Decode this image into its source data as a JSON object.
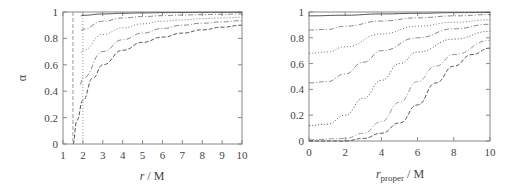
{
  "chart_data": [
    {
      "type": "line",
      "title": "",
      "xlabel": "r / M",
      "ylabel": "α",
      "xlim": [
        1,
        10
      ],
      "ylim": [
        0,
        1
      ],
      "xticks": [
        1,
        2,
        3,
        4,
        5,
        6,
        7,
        8,
        9,
        10
      ],
      "yticks": [
        0,
        0.2,
        0.4,
        0.6,
        0.8,
        1
      ],
      "ytick_labels": [
        "0",
        "0.2",
        "0.4",
        "0.6",
        "0.8",
        "1"
      ],
      "grid": false,
      "legend": null,
      "vertical_lines": [
        {
          "x": 1.5,
          "style": "dashed"
        },
        {
          "x": 2.0,
          "style": "dotted"
        }
      ],
      "series": [
        {
          "name": "curve-1",
          "style": "solid",
          "x": [
            1.9,
            2,
            3,
            4,
            5,
            6,
            7,
            8,
            9,
            10
          ],
          "values": [
            0.97,
            0.975,
            0.985,
            0.99,
            0.993,
            0.995,
            0.996,
            0.997,
            0.998,
            0.998
          ]
        },
        {
          "name": "curve-2",
          "style": "dash-dot",
          "x": [
            1.9,
            2,
            3,
            4,
            5,
            6,
            7,
            8,
            9,
            10
          ],
          "values": [
            0.86,
            0.87,
            0.93,
            0.955,
            0.965,
            0.972,
            0.977,
            0.98,
            0.983,
            0.985
          ]
        },
        {
          "name": "curve-3",
          "style": "dotted",
          "x": [
            1.9,
            2,
            3,
            4,
            5,
            6,
            7,
            8,
            9,
            10
          ],
          "values": [
            0.69,
            0.71,
            0.83,
            0.88,
            0.91,
            0.93,
            0.94,
            0.95,
            0.955,
            0.96
          ]
        },
        {
          "name": "curve-4",
          "style": "dash-dot",
          "x": [
            1.85,
            2,
            3,
            4,
            5,
            6,
            7,
            8,
            9,
            10
          ],
          "values": [
            0.45,
            0.5,
            0.7,
            0.79,
            0.84,
            0.875,
            0.9,
            0.915,
            0.925,
            0.935
          ]
        },
        {
          "name": "curve-5",
          "style": "dashed",
          "x": [
            1.5,
            1.7,
            2,
            2.5,
            3,
            4,
            5,
            6,
            7,
            8,
            9,
            10
          ],
          "values": [
            0.0,
            0.18,
            0.33,
            0.5,
            0.6,
            0.71,
            0.77,
            0.81,
            0.84,
            0.865,
            0.885,
            0.9
          ]
        }
      ]
    },
    {
      "type": "line",
      "title": "",
      "xlabel": "r_proper / M",
      "ylabel": "",
      "xlim": [
        0,
        10
      ],
      "ylim": [
        0,
        1
      ],
      "xticks": [
        0,
        2,
        4,
        6,
        8,
        10
      ],
      "yticks": [
        0,
        0.2,
        0.4,
        0.6,
        0.8,
        1
      ],
      "ytick_labels": [
        "0",
        "0.2",
        "0.4",
        "0.6",
        "0.8",
        "1"
      ],
      "grid": false,
      "legend": null,
      "series": [
        {
          "name": "curve-1",
          "style": "solid",
          "x": [
            0,
            2,
            4,
            6,
            8,
            10
          ],
          "values": [
            0.97,
            0.975,
            0.985,
            0.99,
            0.995,
            0.997
          ]
        },
        {
          "name": "curve-2",
          "style": "dash-dot",
          "x": [
            0,
            1,
            2,
            4,
            6,
            8,
            10
          ],
          "values": [
            0.86,
            0.865,
            0.89,
            0.93,
            0.955,
            0.97,
            0.98
          ]
        },
        {
          "name": "curve-3",
          "style": "dotted",
          "x": [
            0,
            1,
            2,
            4,
            6,
            8,
            10
          ],
          "values": [
            0.68,
            0.69,
            0.73,
            0.83,
            0.89,
            0.92,
            0.94
          ]
        },
        {
          "name": "curve-4",
          "style": "dash-dot",
          "x": [
            0,
            1,
            2,
            3,
            4,
            6,
            8,
            10
          ],
          "values": [
            0.45,
            0.46,
            0.52,
            0.61,
            0.7,
            0.8,
            0.87,
            0.905
          ]
        },
        {
          "name": "curve-5",
          "style": "dotted",
          "x": [
            0,
            1,
            2,
            3,
            4,
            5,
            6,
            8,
            10
          ],
          "values": [
            0.12,
            0.13,
            0.2,
            0.33,
            0.47,
            0.6,
            0.69,
            0.79,
            0.85
          ]
        },
        {
          "name": "curve-6",
          "style": "dash-dot",
          "x": [
            0,
            2,
            3,
            4,
            5,
            6,
            7,
            8,
            10
          ],
          "values": [
            0.01,
            0.02,
            0.06,
            0.15,
            0.3,
            0.46,
            0.58,
            0.67,
            0.78
          ]
        },
        {
          "name": "curve-7",
          "style": "dashed",
          "x": [
            0,
            2,
            3,
            4,
            5,
            6,
            7,
            8,
            9,
            10
          ],
          "values": [
            0.0,
            0.0,
            0.02,
            0.06,
            0.14,
            0.28,
            0.45,
            0.58,
            0.67,
            0.72
          ]
        }
      ]
    }
  ],
  "left_plot": {
    "xlabel_var": "r",
    "xlabel_rest": " / M",
    "ylabel": "α",
    "xtick_labels": [
      "1",
      "2",
      "3",
      "4",
      "5",
      "6",
      "7",
      "8",
      "9",
      "10"
    ],
    "ytick_labels": [
      "0",
      "0.2",
      "0.4",
      "0.6",
      "0.8",
      "1"
    ]
  },
  "right_plot": {
    "xlabel_var": "r",
    "xlabel_sub": "proper",
    "xlabel_rest": " / M",
    "xtick_labels": [
      "0",
      "2",
      "4",
      "6",
      "8",
      "10"
    ],
    "ytick_labels": [
      "0",
      "0.2",
      "0.4",
      "0.6",
      "0.8",
      "1"
    ]
  },
  "colors": {
    "frame": "#888888",
    "curves": [
      "#555555",
      "#888888",
      "#777777",
      "#888888",
      "#555555",
      "#999999",
      "#555555"
    ]
  }
}
